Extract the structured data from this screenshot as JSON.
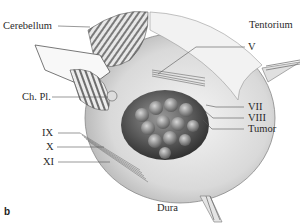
{
  "figure": {
    "panel_label": "b",
    "labels": {
      "cerebellum": "Cerebellum",
      "tentorium": "Tentorium",
      "nerve_v": "V",
      "choroid_plexus": "Ch. Pl.",
      "nerve_vii": "VII",
      "nerve_viii": "VIII",
      "tumor": "Tumor",
      "nerve_ix": "IX",
      "nerve_x": "X",
      "nerve_xi": "XI",
      "dura": "Dura"
    },
    "colors": {
      "background": "#ffffff",
      "label_text": "#2a2a2a",
      "leader_line": "#555555",
      "tumor_dark": "#3c3c3c",
      "tumor_light": "#bdbdbd",
      "dura_shade": "#d8d8d8"
    }
  }
}
